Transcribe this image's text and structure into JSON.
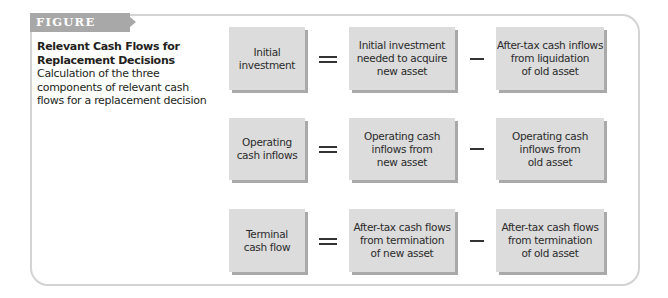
{
  "figure": {
    "label": "FIGURE 11.2",
    "title": "Relevant Cash Flows for Replacement Decisions",
    "description": "Calculation of the three components of relevant cash flows for a replacement decision"
  },
  "rows": [
    {
      "result": "Initial\ninvestment",
      "operator1": "=",
      "term1": "Initial investment\nneeded to acquire\nnew asset",
      "operator2": "−",
      "term2": "After-tax cash inflows\nfrom liquidation\nof old asset"
    },
    {
      "result": "Operating\ncash inflows",
      "operator1": "=",
      "term1": "Operating cash\ninflows from\nnew asset",
      "operator2": "−",
      "term2": "Operating cash\ninflows from\nold asset"
    },
    {
      "result": "Terminal\ncash flow",
      "operator1": "=",
      "term1": "After-tax cash flows\nfrom termination\nof new asset",
      "operator2": "−",
      "term2": "After-tax cash flows\nfrom termination\nof old asset"
    }
  ],
  "colors": {
    "box_fill": "#dcdcdc",
    "box_shadow": "#a9a9a9",
    "label_fill": "#a8a8a8",
    "frame_border": "#d3d3d3"
  }
}
